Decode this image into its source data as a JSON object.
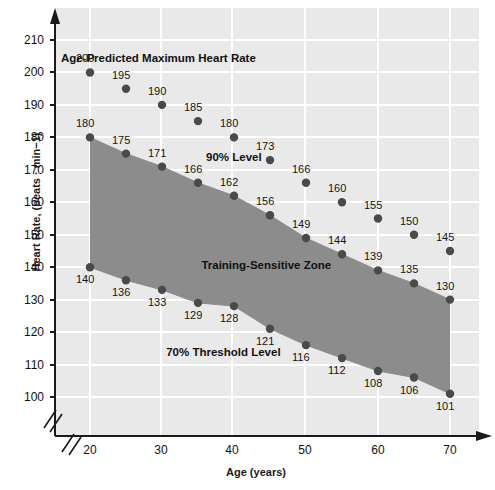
{
  "chart_data": {
    "type": "scatter",
    "title": "Age-Predicted Maximum Heart Rate",
    "xlabel": "Age (years)",
    "ylabel": "Heart Rate, (beats · min−1)",
    "xlim": [
      20,
      70
    ],
    "ylim": [
      95,
      215
    ],
    "xticks": [
      20,
      30,
      40,
      50,
      60,
      70
    ],
    "yticks": [
      100,
      110,
      120,
      130,
      140,
      150,
      160,
      170,
      180,
      190,
      200,
      210
    ],
    "grid": true,
    "legend": "none",
    "axis_break": true,
    "x": [
      20,
      25,
      30,
      35,
      40,
      45,
      50,
      55,
      60,
      65,
      70
    ],
    "series": [
      {
        "name": "Age-Predicted Maximum Heart Rate",
        "values": [
          200,
          195,
          190,
          185,
          180,
          173,
          166,
          160,
          155,
          150,
          145
        ]
      },
      {
        "name": "90% Level",
        "values": [
          180,
          175,
          171,
          166,
          162,
          156,
          149,
          144,
          139,
          135,
          130
        ]
      },
      {
        "name": "70% Threshold Level",
        "values": [
          140,
          136,
          133,
          129,
          128,
          121,
          116,
          112,
          108,
          106,
          101
        ]
      }
    ],
    "shaded_region": {
      "name": "Training-Sensitive Zone",
      "upper_series": "90% Level",
      "lower_series": "70% Threshold Level",
      "color": "#8c8c8c"
    },
    "annotations": [
      {
        "text": "Age-Predicted Maximum Heart Rate",
        "x": 29.5,
        "y": 204
      },
      {
        "text": "90% Level",
        "x": 40.0,
        "y": 173.5
      },
      {
        "text": "Training-Sensitive Zone",
        "x": 44.5,
        "y": 140.5
      },
      {
        "text": "70% Threshold Level",
        "x": 38.5,
        "y": 113.5
      }
    ],
    "colors": {
      "plot_background": "#e9e9e9",
      "grid": "#ffffff",
      "axis": "#1a1a1a",
      "marker": "#4a4a4a",
      "zone_fill": "#8c8c8c",
      "text": "#141414",
      "page_background": "#ffffff"
    }
  },
  "axis": {
    "ytick_labels": [
      "210",
      "200",
      "190",
      "180",
      "170",
      "160",
      "150",
      "140",
      "130",
      "120",
      "110",
      "100"
    ],
    "xtick_labels": [
      "20",
      "30",
      "40",
      "50",
      "60",
      "70"
    ],
    "ylabel": "Heart Rate, (beats · min−1)",
    "xlabel": "Age (years)"
  },
  "point_labels": {
    "max": [
      "200",
      "195",
      "190",
      "185",
      "180",
      "173",
      "166",
      "160",
      "155",
      "150",
      "145"
    ],
    "ninety": [
      "180",
      "175",
      "171",
      "166",
      "162",
      "156",
      "149",
      "144",
      "139",
      "135",
      "130"
    ],
    "seventy": [
      "140",
      "136",
      "133",
      "129",
      "128",
      "121",
      "116",
      "112",
      "108",
      "106",
      "101"
    ]
  },
  "annotations": {
    "title": "Age-Predicted Maximum Heart Rate",
    "ninety_level": "90% Level",
    "zone": "Training-Sensitive Zone",
    "seventy_level": "70% Threshold Level"
  }
}
